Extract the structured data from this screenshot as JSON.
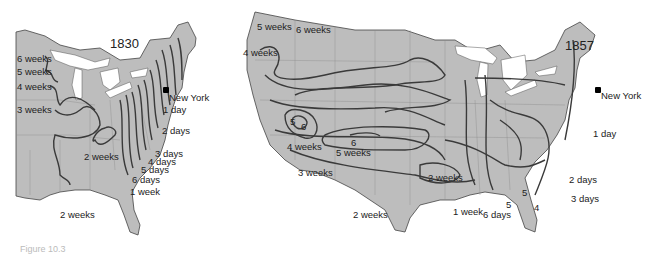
{
  "maps": [
    {
      "year": "1830",
      "origin": "New York",
      "isochrone_labels": [
        "6 weeks",
        "5 weeks",
        "4 weeks",
        "3 weeks",
        "2 weeks",
        "1 day",
        "2 days",
        "3 days",
        "4 days",
        "5 days",
        "6 days",
        "1 week",
        "2 weeks"
      ]
    },
    {
      "year": "1857",
      "origin": "New York",
      "isochrone_labels": [
        "5 weeks",
        "6 weeks",
        "4 weeks",
        "5",
        "6",
        "6",
        "4 weeks",
        "5 weeks",
        "3 weeks",
        "2 weeks",
        "2 weeks",
        "1 week",
        "6 days",
        "5",
        "5",
        "4",
        "1 day",
        "2 days",
        "3 days"
      ]
    }
  ],
  "colors": {
    "land": "#bdbdbd",
    "lakes": "#ffffff",
    "isochrone": "#3a3a3a",
    "borders": "#8a8a8a"
  },
  "caption": "Figure 10.3"
}
